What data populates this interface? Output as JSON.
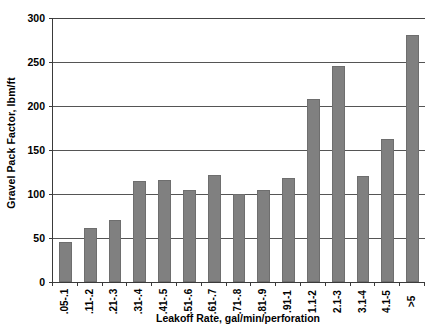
{
  "chart_data": {
    "type": "bar",
    "title": "",
    "subtitle": "",
    "xlabel": "Leakoff Rate, gal/min/perforation",
    "ylabel": "Gravel Pack Factor, lbm/ft",
    "categories": [
      ".05-.1",
      ".11-.2",
      ".21-.3",
      ".31-.4",
      ".41-.5",
      ".51-.6",
      ".61-.7",
      ".71-.8",
      ".81-.9",
      ".91-1",
      "1.1-2",
      "2.1-3",
      "3.1-4",
      "4.1-5",
      ">5"
    ],
    "values": [
      45,
      61,
      70,
      115,
      116,
      104,
      122,
      100,
      105,
      118,
      208,
      246,
      120,
      162,
      281
    ],
    "ylim": [
      0,
      300
    ],
    "ytick_labels": [
      "0",
      "50",
      "100",
      "150",
      "200",
      "250",
      "300"
    ],
    "ytick_values": [
      0,
      50,
      100,
      150,
      200,
      250,
      300
    ],
    "grid": "horizontal",
    "legend": "none",
    "bar_color": "#808080",
    "axis_color": "#3a3a3a",
    "gridline_color": "#555555",
    "background_color": "#ffffff"
  }
}
